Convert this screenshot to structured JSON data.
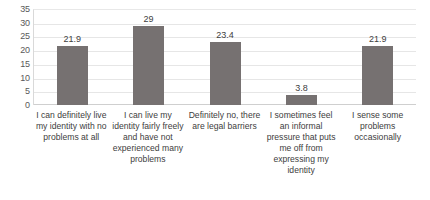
{
  "chart_data": {
    "type": "bar",
    "title": "",
    "xlabel": "",
    "ylabel": "",
    "ylim": [
      0,
      35
    ],
    "yticks": [
      35,
      30,
      25,
      20,
      15,
      10,
      5,
      0
    ],
    "grid": true,
    "legend": "none",
    "bar_color": "#767171",
    "categories": [
      "I can definitely live my identity with no problems at all",
      "I can live my identity fairly freely and have not experienced many problems",
      "Definitely no, there are legal barriers",
      "I sometimes feel an informal pressure that puts me off from expressing my identity",
      "I sense some problems occasionally"
    ],
    "values": [
      21.9,
      29,
      23.4,
      3.8,
      21.9
    ],
    "value_labels": [
      "21.9",
      "29",
      "23.4",
      "3.8",
      "21.9"
    ]
  }
}
